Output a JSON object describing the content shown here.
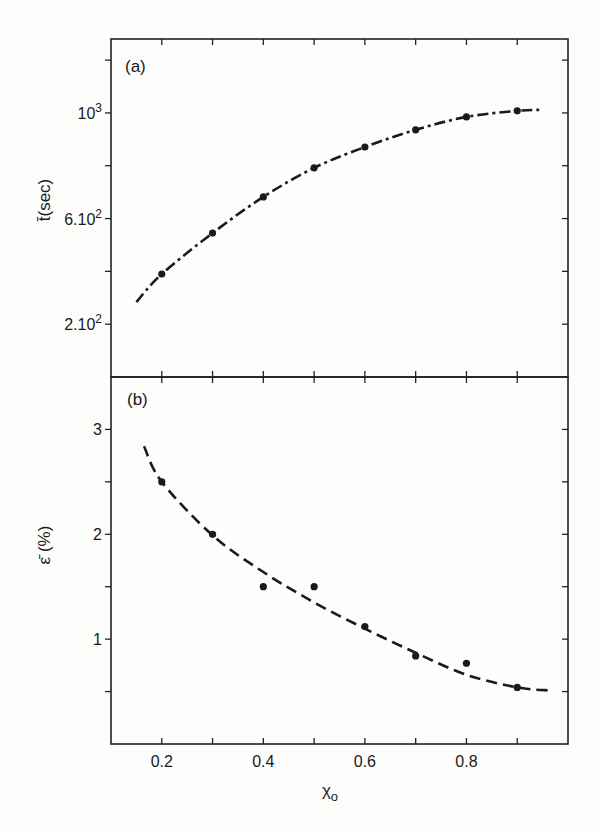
{
  "chart_data": [
    {
      "type": "line",
      "panel_label": "(a)",
      "title": "",
      "xlabel": "χ",
      "xlabel_subscript": "o",
      "ylabel": "t̄(sec)",
      "xlim": [
        0.1,
        1.0
      ],
      "ylim": [
        0,
        1280
      ],
      "x_ticks": [
        0.2,
        0.3,
        0.4,
        0.5,
        0.6,
        0.7,
        0.8,
        0.9
      ],
      "y_ticks": [
        200,
        400,
        600,
        800,
        1000,
        1200
      ],
      "y_tick_labels": [
        {
          "value": 200,
          "mantissa": "2.10",
          "exp": "2"
        },
        {
          "value": 600,
          "mantissa": "6.10",
          "exp": "2"
        },
        {
          "value": 1000,
          "mantissa": "10",
          "exp": "3"
        }
      ],
      "grid": false,
      "series": [
        {
          "name": "measured",
          "style": "points",
          "x": [
            0.2,
            0.3,
            0.4,
            0.5,
            0.6,
            0.7,
            0.8,
            0.9
          ],
          "y": [
            390,
            545,
            682,
            792,
            871,
            936,
            985,
            1008
          ]
        },
        {
          "name": "fit",
          "style": "dash-dot",
          "x": [
            0.15,
            0.2,
            0.3,
            0.4,
            0.5,
            0.6,
            0.7,
            0.8,
            0.9,
            0.95
          ],
          "y": [
            284,
            390,
            545,
            682,
            792,
            871,
            936,
            985,
            1008,
            1012
          ]
        }
      ]
    },
    {
      "type": "line",
      "panel_label": "(b)",
      "title": "",
      "xlabel": "χ",
      "xlabel_subscript": "o",
      "ylabel": "ε̄ (%)",
      "xlim": [
        0.1,
        1.0
      ],
      "ylim": [
        0,
        3.5
      ],
      "x_ticks": [
        0.2,
        0.3,
        0.4,
        0.5,
        0.6,
        0.7,
        0.8,
        0.9
      ],
      "x_tick_labels": [
        "0.2",
        "0.4",
        "0.6",
        "0.8"
      ],
      "x_tick_label_values": [
        0.2,
        0.4,
        0.6,
        0.8
      ],
      "y_ticks": [
        0.5,
        1,
        1.5,
        2,
        2.5,
        3
      ],
      "y_tick_labels": [
        {
          "value": 1,
          "label": "1"
        },
        {
          "value": 2,
          "label": "2"
        },
        {
          "value": 3,
          "label": "3"
        }
      ],
      "grid": false,
      "series": [
        {
          "name": "measured",
          "style": "points",
          "x": [
            0.2,
            0.3,
            0.4,
            0.5,
            0.6,
            0.7,
            0.8,
            0.9
          ],
          "y": [
            2.5,
            2.0,
            1.5,
            1.5,
            1.12,
            0.84,
            0.77,
            0.54
          ]
        },
        {
          "name": "fit",
          "style": "dashed",
          "x": [
            0.165,
            0.2,
            0.3,
            0.4,
            0.5,
            0.6,
            0.7,
            0.8,
            0.9,
            0.965
          ],
          "y": [
            2.84,
            2.5,
            1.99,
            1.64,
            1.35,
            1.1,
            0.87,
            0.66,
            0.54,
            0.51
          ]
        }
      ]
    }
  ]
}
